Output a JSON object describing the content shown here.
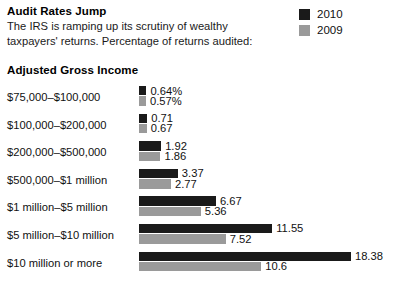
{
  "header": {
    "title": "Audit Rates Jump",
    "subtitle_line1": "The IRS is ramping up its scrutiny of wealthy",
    "subtitle_line2": "taxpayers' returns. Percentage of returns audited:"
  },
  "legend": {
    "items": [
      {
        "label": "2010",
        "swatch": "dark",
        "color": "#1a1a1a"
      },
      {
        "label": "2009",
        "swatch": "gray",
        "color": "#9a9a9a"
      }
    ]
  },
  "axis_heading": "Adjusted Gross Income",
  "colors": {
    "series_2010": "#1a1a1a",
    "series_2009": "#9a9a9a",
    "background": "#ffffff",
    "text": "#111111"
  },
  "chart_data": {
    "type": "bar",
    "orientation": "horizontal",
    "title": "Audit Rates Jump",
    "subtitle": "The IRS is ramping up its scrutiny of wealthy taxpayers' returns. Percentage of returns audited:",
    "xlabel": "",
    "ylabel": "Adjusted Gross Income",
    "xlim": [
      0,
      18.38
    ],
    "grid": false,
    "legend_position": "top-right",
    "categories": [
      "$75,000–$100,000",
      "$100,000–$200,000",
      "$200,000–$500,000",
      "$500,000–$1 million",
      "$1 million–$5 million",
      "$5 million–$10 million",
      "$10 million or more"
    ],
    "series": [
      {
        "name": "2010",
        "color": "#1a1a1a",
        "values": [
          0.64,
          0.71,
          1.92,
          3.37,
          6.67,
          11.55,
          18.38
        ],
        "labels": [
          "0.64%",
          "0.71",
          "1.92",
          "3.37",
          "6.67",
          "11.55",
          "18.38"
        ]
      },
      {
        "name": "2009",
        "color": "#9a9a9a",
        "values": [
          0.57,
          0.67,
          1.86,
          2.77,
          5.36,
          7.52,
          10.6
        ],
        "labels": [
          "0.57%",
          "0.67",
          "1.86",
          "2.77",
          "5.36",
          "7.52",
          "10.6"
        ]
      }
    ]
  }
}
